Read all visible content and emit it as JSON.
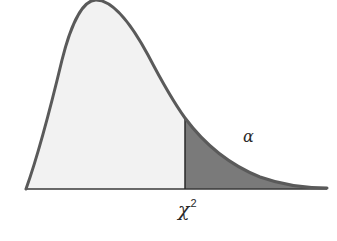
{
  "diagram": {
    "type": "chi-square-distribution",
    "labels": {
      "alpha": "α",
      "critical_value": "χ",
      "critical_value_exponent": "2"
    },
    "colors": {
      "curve": "#5a5a5a",
      "acceptance_fill": "#f2f2f2",
      "rejection_fill": "#7a7a7a",
      "baseline": "#3a3a3a",
      "background": "#ffffff"
    }
  }
}
